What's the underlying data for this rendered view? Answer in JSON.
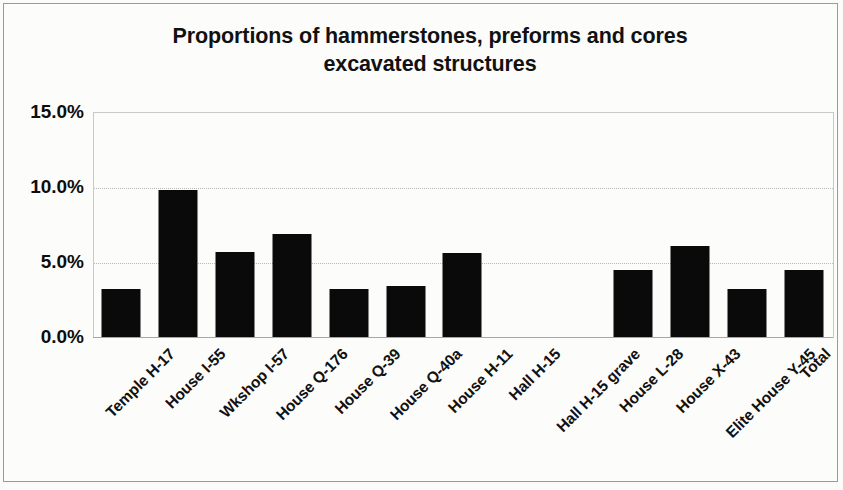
{
  "chart_data": {
    "type": "bar",
    "title": "Proportions of hammerstones, preforms and cores excavated structures",
    "title_lines": [
      "Proportions of hammerstones, preforms and cores",
      "excavated structures"
    ],
    "xlabel": "",
    "ylabel": "",
    "categories": [
      "Temple H-17",
      "House I-55",
      "Wkshop I-57",
      "House Q-176",
      "House Q-39",
      "House Q-40a",
      "House H-11",
      "Hall H-15",
      "Hall H-15 grave",
      "House L-28",
      "House X-43",
      "Elite House Y-45",
      "Total"
    ],
    "values": [
      3.2,
      9.8,
      5.7,
      6.9,
      3.2,
      3.4,
      5.6,
      0.0,
      0.0,
      4.5,
      6.1,
      3.2,
      4.5
    ],
    "ytick_labels": [
      "0.0%",
      "5.0%",
      "10.0%",
      "15.0%"
    ],
    "ytick_values": [
      0,
      5,
      10,
      15
    ],
    "ylim": [
      0,
      15
    ],
    "grid": true,
    "legend": false,
    "bar_color": "#0a0a0a",
    "background_color": "#fcfcfb",
    "gridline_color": "#b9b9b9",
    "axis_color": "#a6a6a6"
  }
}
